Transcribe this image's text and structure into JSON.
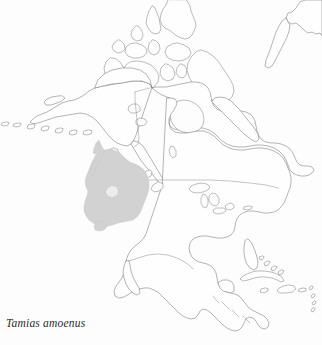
{
  "figure": {
    "caption": "Tamias amoenus",
    "caption_style": "italic-serif",
    "background_color": "#fdfdfd",
    "width_px": 322,
    "height_px": 345
  },
  "map": {
    "name": "north-america-outline-map",
    "projection_look": "conic",
    "coastline_color": "#6a6a6a",
    "border_color": "#7d7d7d",
    "land_fill": "#fefefe",
    "regions_depicted": [
      "Alaska",
      "Aleutian Islands",
      "Canada",
      "Canadian Arctic Archipelago",
      "Baffin Island",
      "Greenland (western tip)",
      "Hudson Bay",
      "Newfoundland",
      "United States",
      "Great Lakes",
      "Florida",
      "Baja California",
      "Mexico",
      "Central America",
      "Cuba",
      "Hispaniola",
      "Caribbean islands"
    ]
  },
  "range_overlay": {
    "name": "species-distribution-range",
    "species": "Tamias amoenus",
    "common_area": "Pacific Northwest and Northern Rocky Mountains",
    "fill_color": "#d2d2d2",
    "hole_color": "#ededed",
    "approx_bounds_px": {
      "x": 78,
      "y": 146,
      "width": 72,
      "height": 82
    }
  }
}
